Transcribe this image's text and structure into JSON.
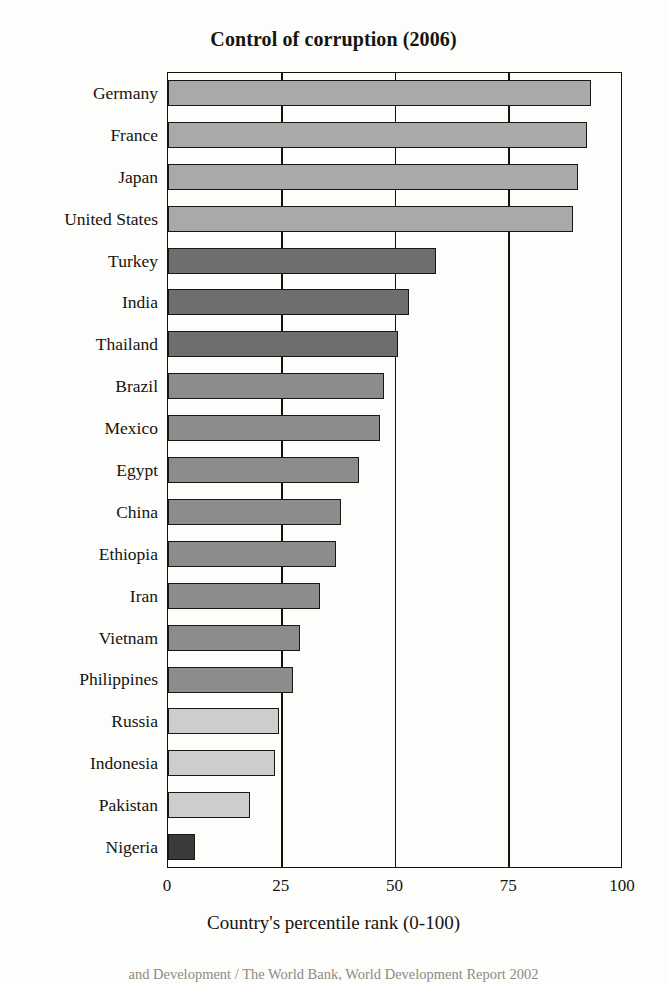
{
  "chart_data": {
    "type": "bar",
    "orientation": "horizontal",
    "title": "Control of corruption (2006)",
    "xlabel": "Country's percentile rank (0-100)",
    "ylabel": "",
    "xlim": [
      0,
      100
    ],
    "xticks": [
      0,
      25,
      50,
      75,
      100
    ],
    "grid": true,
    "grid_axis": "x",
    "legend": "none",
    "categories": [
      "Germany",
      "France",
      "Japan",
      "United States",
      "Turkey",
      "India",
      "Thailand",
      "Brazil",
      "Mexico",
      "Egypt",
      "China",
      "Ethiopia",
      "Iran",
      "Vietnam",
      "Philippines",
      "Russia",
      "Indonesia",
      "Pakistan",
      "Nigeria"
    ],
    "values": [
      93,
      92,
      90,
      89,
      59,
      53,
      50.5,
      47.5,
      46.5,
      42,
      38,
      37,
      33.5,
      29,
      27.5,
      24.5,
      23.5,
      18,
      6
    ],
    "bar_colors": [
      "#a9a9a9",
      "#a9a9a9",
      "#a9a9a9",
      "#a9a9a9",
      "#6e6e6e",
      "#6e6e6e",
      "#6e6e6e",
      "#8c8c8c",
      "#8c8c8c",
      "#8c8c8c",
      "#8c8c8c",
      "#8c8c8c",
      "#8c8c8c",
      "#8c8c8c",
      "#8c8c8c",
      "#cdcdcd",
      "#cdcdcd",
      "#cdcdcd",
      "#3a3a3a"
    ],
    "bar_edge_color": "#1a1713",
    "axis_color": "#15120d",
    "background": "#fdfdfb"
  },
  "source_note": "and Development / The World Bank, World Development Report 2002"
}
